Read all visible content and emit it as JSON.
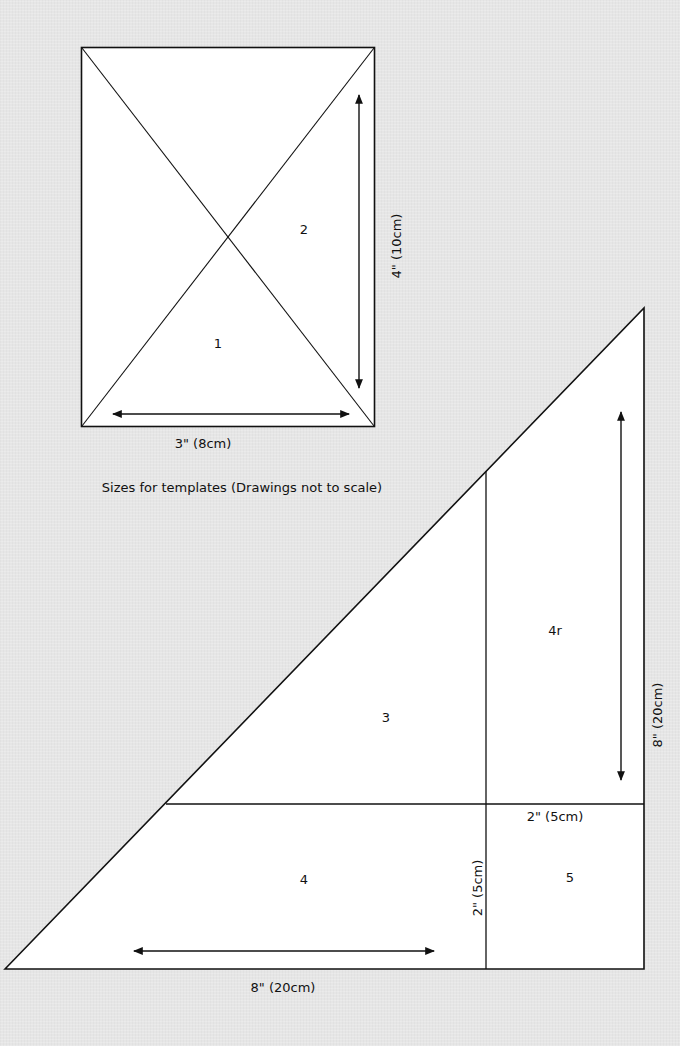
{
  "caption": "Sizes for templates (Drawings not to scale)",
  "colors": {
    "background": "#e6e6e6",
    "shape_fill": "#ffffff",
    "line": "#111111"
  },
  "template_a": {
    "name": "Rectangle template",
    "pieces": {
      "piece_1": "1",
      "piece_2": "2"
    },
    "dimensions": {
      "width": "3\" (8cm)",
      "height": "4\" (10cm)"
    }
  },
  "template_b": {
    "name": "Triangle template",
    "pieces": {
      "piece_3": "3",
      "piece_4": "4",
      "piece_4r": "4r",
      "piece_5": "5"
    },
    "dimensions": {
      "base": "8\" (20cm)",
      "height": "8\" (20cm)",
      "square_width": "2\" (5cm)",
      "square_height": "2\" (5cm)"
    }
  }
}
